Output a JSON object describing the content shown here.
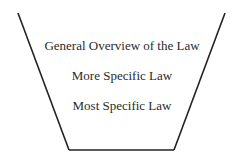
{
  "diagram": {
    "type": "funnel",
    "levels": [
      {
        "label": "General Overview of the Law"
      },
      {
        "label": "More Specific Law"
      },
      {
        "label": "Most Specific Law"
      }
    ],
    "colors": {
      "line": "#222222",
      "text": "#2a2a2a",
      "background": "#ffffff"
    }
  }
}
